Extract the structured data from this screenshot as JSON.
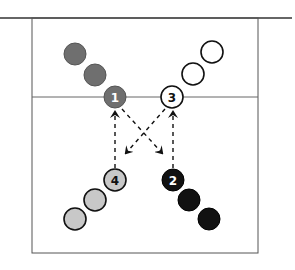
{
  "diagram": {
    "colors": {
      "line": "#333333",
      "group1_fill": "#6f6f6f",
      "group2_fill": "#111111",
      "group3_fill": "#ffffff",
      "group4_fill": "#c8c8c8"
    },
    "players": [
      {
        "label": "1",
        "group": "dark-gray",
        "x": 115,
        "y": 97
      },
      {
        "label": "3",
        "group": "white",
        "x": 172,
        "y": 97
      },
      {
        "label": "4",
        "group": "light-gray",
        "x": 115,
        "y": 180
      },
      {
        "label": "2",
        "group": "black",
        "x": 173,
        "y": 180
      }
    ],
    "labels": {
      "p1": "1",
      "p2": "2",
      "p3": "3",
      "p4": "4"
    },
    "arrows": [
      {
        "from": "4",
        "to": "1",
        "style": "dashed"
      },
      {
        "from": "2",
        "to": "3",
        "style": "dashed"
      },
      {
        "from": "1",
        "to": "2",
        "style": "dashed"
      },
      {
        "from": "3",
        "to": "4",
        "style": "dashed"
      }
    ]
  }
}
